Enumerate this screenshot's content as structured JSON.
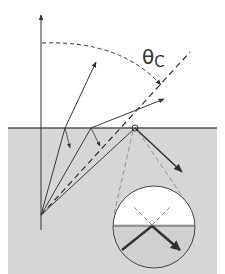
{
  "diagram": {
    "title_symbol": "θ",
    "title_subscript": "C",
    "colors": {
      "background": "#ffffff",
      "medium": "#d6d6d6",
      "interface": "#555555",
      "ray": "#3a3a3a",
      "dashed": "#333333",
      "inset_upper": "#ffffff",
      "inset_lower": "#d0d0d0"
    },
    "regions": {
      "upper_medium": "air (low refractive index)",
      "lower_medium": "dense medium (high refractive index)"
    },
    "inset": {
      "label": "magnified view of reflection point"
    }
  }
}
